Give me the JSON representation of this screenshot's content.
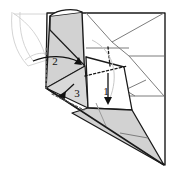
{
  "figure": {
    "type": "origami-fold-diagram",
    "canvas": {
      "width": 171,
      "height": 178
    },
    "background_color": "#ffffff"
  },
  "colors": {
    "outline": "#1a1a1a",
    "crease_solid": "#555555",
    "crease_light": "#bdbdbd",
    "ghost_line": "#cccccc",
    "fill_shaded": "#d2d2d2",
    "fill_shaded_light": "#dcdcdc",
    "fill_white": "#ffffff",
    "arrow": "#111111",
    "dotted": "#1a1a1a"
  },
  "steps": [
    {
      "id": "step-1",
      "label": "1",
      "x": 108,
      "y": 92,
      "arrow": "down-curved",
      "description": "fold front flap downward"
    },
    {
      "id": "step-2",
      "label": "2",
      "x": 55,
      "y": 62,
      "arrow": "right-curved",
      "description": "fold edge to the right"
    },
    {
      "id": "step-3",
      "label": "3",
      "x": 76,
      "y": 92,
      "arrow": "down-left-short",
      "description": "fold small flap down-left"
    }
  ],
  "annotations": {
    "arrow_count": 3,
    "dotted_crease_count": 2,
    "shaded_face_count": 3
  }
}
